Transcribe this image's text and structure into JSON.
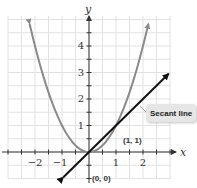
{
  "chart_data": {
    "type": "line",
    "title": "",
    "xlabel": "x",
    "ylabel": "y",
    "xlim": [
      -3,
      3
    ],
    "ylim": [
      -1,
      5
    ],
    "x_ticks": [
      -2,
      -1,
      1,
      2
    ],
    "x_tick_labels": [
      "−2",
      "−1",
      "1",
      "2"
    ],
    "y_ticks": [
      1,
      2,
      3,
      4
    ],
    "y_tick_labels": [
      "1",
      "2",
      "3",
      "4"
    ],
    "grid": true,
    "grid_step": 0.5,
    "series": [
      {
        "name": "y = x^2",
        "kind": "curve",
        "color": "#8a8a8a",
        "x": [
          -2.2,
          -2,
          -1.5,
          -1,
          -0.5,
          0,
          0.5,
          1,
          1.5,
          2,
          2.2
        ],
        "y": [
          4.84,
          4,
          2.25,
          1,
          0.25,
          0,
          0.25,
          1,
          2.25,
          4,
          4.84
        ]
      },
      {
        "name": "Secant line",
        "kind": "line",
        "color": "#111111",
        "x": [
          -0.95,
          2.95
        ],
        "y": [
          -0.95,
          2.95
        ]
      }
    ],
    "annotations": [
      {
        "text": "Secant line",
        "type": "callout",
        "x": 2.2,
        "y": 1.4
      },
      {
        "text": "(1, 1)",
        "type": "point-label",
        "x": 1,
        "y": 1
      },
      {
        "text": "(0, 0)",
        "type": "point-label",
        "x": 0,
        "y": 0
      }
    ]
  },
  "labels": {
    "x_axis": "x",
    "y_axis": "y",
    "x_ticks": [
      "−2",
      "−1",
      "1",
      "2"
    ],
    "y_ticks": [
      "1",
      "2",
      "3",
      "4"
    ],
    "secant_callout": "Secant line",
    "point_1_1": "(1, 1)",
    "point_0_0": "(0, 0)"
  },
  "colors": {
    "grid": "#e2e2e2",
    "axis": "#333333",
    "parabola": "#8a8a8a",
    "secant": "#111111",
    "callout_bg": "#e6e6e6"
  }
}
